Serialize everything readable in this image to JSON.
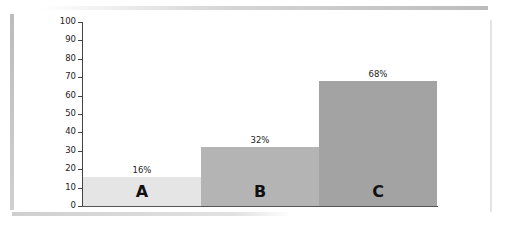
{
  "chart_data": {
    "type": "bar",
    "title": "",
    "xlabel": "",
    "ylabel": "",
    "categories": [
      "A",
      "B",
      "C"
    ],
    "values": [
      16,
      32,
      68
    ],
    "value_labels": [
      "16%",
      "32%",
      "68%"
    ],
    "ylim": [
      0,
      100
    ],
    "yticks": [
      0,
      10,
      20,
      30,
      40,
      50,
      60,
      70,
      80,
      90,
      100
    ],
    "colors": [
      "#e5e5e5",
      "#b4b4b4",
      "#a3a3a3"
    ],
    "grid": false,
    "legend": "none"
  }
}
